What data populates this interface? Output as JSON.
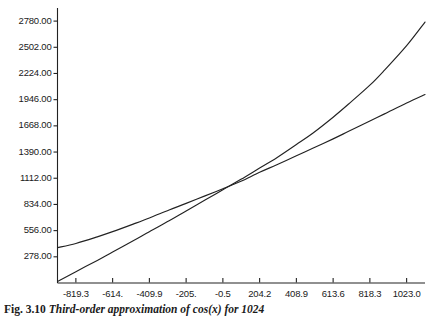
{
  "figure": {
    "caption_label": "Fig. 3.10",
    "caption_text": "Third-order approximation of cos(x) for 1024"
  },
  "chart_data": {
    "type": "line",
    "title": "",
    "xlabel": "",
    "ylabel": "",
    "xlim": [
      -921.65,
      1125.35
    ],
    "ylim": [
      0,
      2919
    ],
    "grid": false,
    "legend": "none",
    "xticks": [
      -819.3,
      -614.6,
      -409.9,
      -205.2,
      -0.5,
      204.2,
      408.9,
      613.6,
      818.3,
      1023.0
    ],
    "xtick_labels": [
      "-819.3",
      "-614.",
      "-409.9",
      "-205.",
      "-0.5",
      "204.2",
      "408.9",
      "613.6",
      "818.3",
      "1023.0"
    ],
    "yticks": [
      278,
      556,
      834,
      1112,
      1390,
      1668,
      1946,
      2224,
      2502,
      2780
    ],
    "ytick_labels": [
      "278.00",
      "556.00",
      "834.00",
      "1112.00",
      "1390.00",
      "1668.00",
      "1946.00",
      "2224.00",
      "2502.00",
      "2780.00"
    ],
    "series": [
      {
        "name": "curve-upper",
        "description": "steeper curve rising to upper right, concave up at right",
        "x": [
          -921.65,
          -819.3,
          -700,
          -614.6,
          -500,
          -409.9,
          -300,
          -205.2,
          -100,
          -0.5,
          100,
          204.2,
          300,
          408.9,
          500,
          613.6,
          700,
          818.3,
          900,
          1023.0,
          1125.35
        ],
        "y": [
          15,
          120,
          240,
          330,
          448,
          545,
          660,
          765,
          880,
          990,
          1100,
          1220,
          1330,
          1470,
          1590,
          1760,
          1900,
          2100,
          2260,
          2520,
          2770
        ]
      },
      {
        "name": "curve-lower",
        "description": "concave-down curve starting high at left, flatter slope at right",
        "x": [
          -921.65,
          -819.3,
          -700,
          -614.6,
          -500,
          -409.9,
          -300,
          -205.2,
          -100,
          -0.5,
          100,
          204.2,
          300,
          408.9,
          500,
          613.6,
          700,
          818.3,
          900,
          1023.0,
          1125.35
        ],
        "y": [
          375,
          420,
          490,
          545,
          625,
          690,
          775,
          845,
          925,
          1000,
          1080,
          1175,
          1255,
          1350,
          1430,
          1530,
          1610,
          1720,
          1795,
          1910,
          2000
        ]
      }
    ],
    "crossings": [
      {
        "x": -205.2,
        "y": 820
      },
      {
        "x": 204.2,
        "y": 1240
      }
    ]
  },
  "axes": {
    "x_axis_name": "x-axis",
    "y_axis_name": "y-axis"
  }
}
